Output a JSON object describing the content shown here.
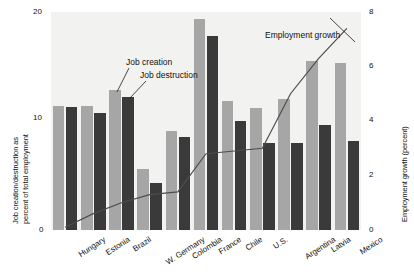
{
  "chart_data": {
    "type": "bar",
    "title": "",
    "categories": [
      "Hungary",
      "Estonia",
      "Brazil",
      "W. Germany",
      "Colombia",
      "France",
      "Chile",
      "U.S.",
      "Argentina",
      "Latvia",
      "Mexico"
    ],
    "series": [
      {
        "name": "Job creation",
        "color": "#a6a6a6",
        "axis": "left",
        "values": [
          11.4,
          11.4,
          12.8,
          5.6,
          9.1,
          19.4,
          11.8,
          11.2,
          12.0,
          15.5,
          15.3
        ]
      },
      {
        "name": "Job destruction",
        "color": "#3a3a3a",
        "axis": "left",
        "values": [
          11.3,
          10.7,
          12.2,
          4.3,
          8.5,
          17.8,
          10.0,
          8.0,
          8.0,
          9.6,
          8.2
        ]
      },
      {
        "name": "Employment growth",
        "color": "#4d4d4d",
        "axis": "right",
        "type": "line",
        "values": [
          0.1,
          0.6,
          1.0,
          1.3,
          1.4,
          2.8,
          2.9,
          3.0,
          5.0,
          6.3,
          7.4
        ]
      }
    ],
    "ylabel": "Job creation/destruction as percent of total employment",
    "ylabel2": "Employment growth (percent)",
    "xlabel": "",
    "ylim": [
      0,
      20
    ],
    "yticks": [
      0,
      10,
      20
    ],
    "ylim2": [
      0,
      8
    ],
    "yticks2": [
      0,
      2,
      4,
      6,
      8
    ],
    "grid": false,
    "legend_position": "inline-annotations",
    "annotations": [
      {
        "text": "Job creation",
        "target": "Brazil creation bar"
      },
      {
        "text": "Job destruction",
        "target": "Brazil destruction bar"
      },
      {
        "text": "Employment growth",
        "target": "employment growth line"
      }
    ]
  },
  "axes": {
    "left_title": "Job creation/destruction as percent of total employment",
    "left_title_line1": "Job creation/destruction as",
    "left_title_line2": "percent of total employment",
    "right_title": "Employment growth (percent)",
    "left_ticks": [
      "20",
      "10",
      "0"
    ],
    "right_ticks": [
      "8",
      "6",
      "4",
      "2",
      "0"
    ]
  },
  "annotations": {
    "job_creation": "Job creation",
    "job_destruction": "Job destruction",
    "employment_growth": "Employment growth"
  }
}
